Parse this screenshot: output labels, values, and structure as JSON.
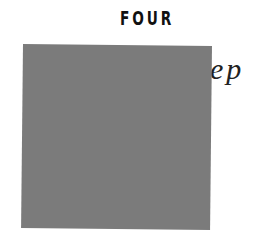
{
  "chapter": {
    "number_label": "FOUR",
    "title": "Out of Sleep"
  },
  "overlay": {
    "color": "#7b7b7b"
  }
}
